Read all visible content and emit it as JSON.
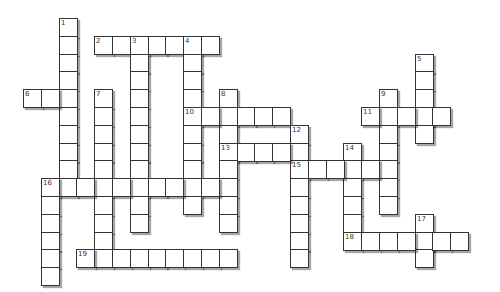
{
  "puzzle": {
    "cell_size": 17.8,
    "origin_x": 23,
    "origin_y": 18,
    "words": [
      {
        "number": "1",
        "direction": "down",
        "row": 0,
        "col": 2,
        "length": 10
      },
      {
        "number": "2",
        "direction": "across",
        "row": 1,
        "col": 4,
        "length": 7
      },
      {
        "number": "3",
        "direction": "down",
        "row": 1,
        "col": 6,
        "length": 11
      },
      {
        "number": "4",
        "direction": "down",
        "row": 1,
        "col": 9,
        "length": 10
      },
      {
        "number": "5",
        "direction": "down",
        "row": 2,
        "col": 22,
        "length": 5
      },
      {
        "number": "6",
        "direction": "across",
        "row": 4,
        "col": 0,
        "length": 3
      },
      {
        "number": "7",
        "direction": "down",
        "row": 4,
        "col": 4,
        "length": 10
      },
      {
        "number": "8",
        "direction": "down",
        "row": 4,
        "col": 11,
        "length": 8
      },
      {
        "number": "9",
        "direction": "down",
        "row": 4,
        "col": 20,
        "length": 7
      },
      {
        "number": "10",
        "direction": "across",
        "row": 5,
        "col": 9,
        "length": 6
      },
      {
        "number": "11",
        "direction": "across",
        "row": 5,
        "col": 19,
        "length": 5
      },
      {
        "number": "12",
        "direction": "down",
        "row": 6,
        "col": 15,
        "length": 8
      },
      {
        "number": "13",
        "direction": "across",
        "row": 7,
        "col": 11,
        "length": 5
      },
      {
        "number": "14",
        "direction": "down",
        "row": 7,
        "col": 18,
        "length": 6
      },
      {
        "number": "15",
        "direction": "across",
        "row": 8,
        "col": 15,
        "length": 6
      },
      {
        "number": "16",
        "direction": "across",
        "row": 9,
        "col": 1,
        "length": 11
      },
      {
        "number": "16d",
        "label": "",
        "direction": "down",
        "row": 9,
        "col": 1,
        "length": 6
      },
      {
        "number": "17",
        "direction": "down",
        "row": 11,
        "col": 22,
        "length": 3
      },
      {
        "number": "18",
        "direction": "across",
        "row": 12,
        "col": 18,
        "length": 7
      },
      {
        "number": "19",
        "direction": "across",
        "row": 13,
        "col": 3,
        "length": 9
      }
    ]
  }
}
